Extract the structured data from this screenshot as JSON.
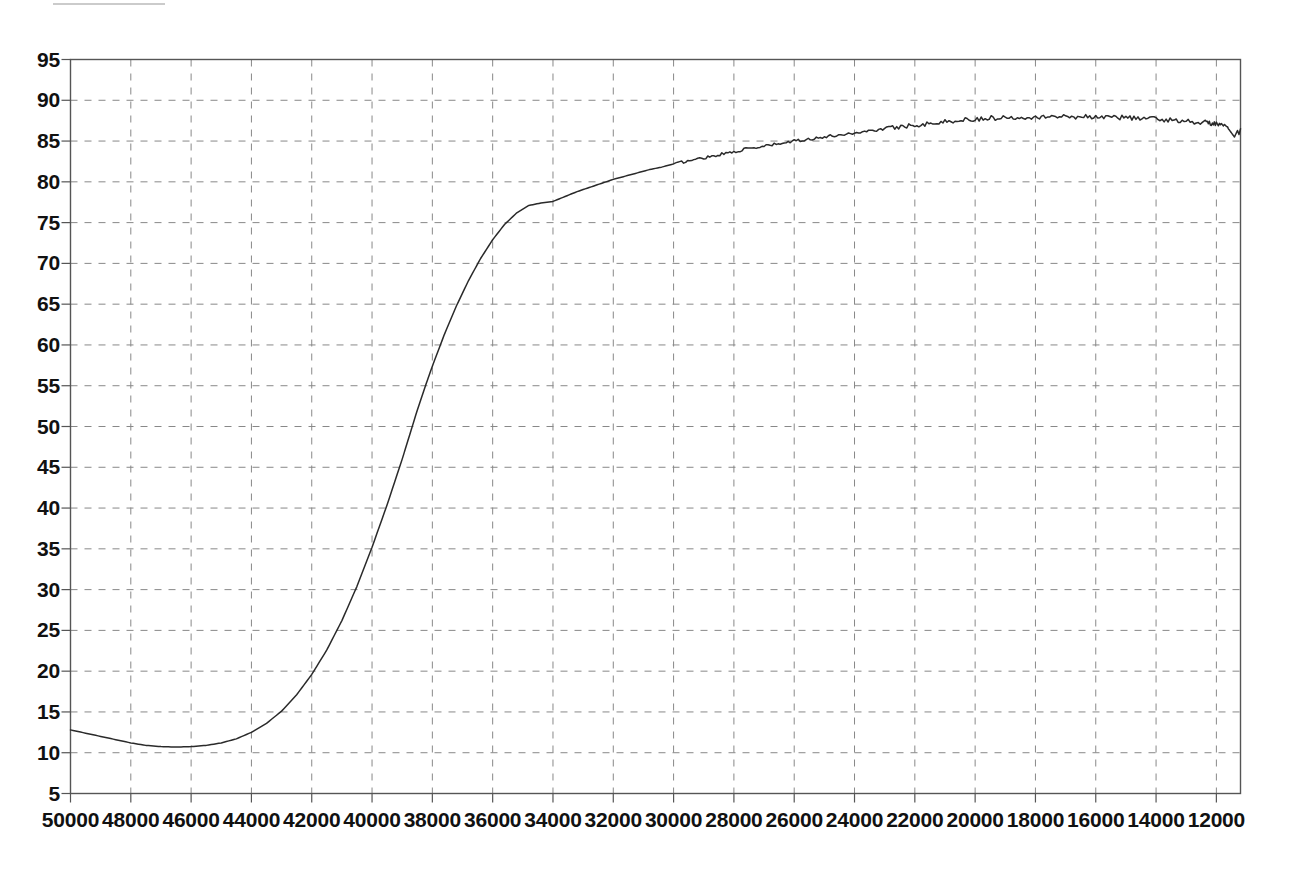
{
  "figure": {
    "name": "spectrum-plot",
    "background_color": "#ffffff",
    "axis_color": "#555555",
    "grid_color": "#888888",
    "curve_color": "#2a2a2a"
  },
  "chart_data": {
    "type": "line",
    "title": "",
    "subtitle": "",
    "xlabel": "",
    "ylabel": "",
    "grid": true,
    "grid_style": "dashed",
    "legend": false,
    "legend_position": "none",
    "x_axis_reversed": true,
    "xlim": [
      50000,
      11200
    ],
    "ylim": [
      5,
      95
    ],
    "x_tick_step": 2000,
    "y_tick_step": 5,
    "xticks": [
      50000,
      48000,
      46000,
      44000,
      42000,
      40000,
      38000,
      36000,
      34000,
      32000,
      30000,
      28000,
      26000,
      24000,
      22000,
      20000,
      18000,
      16000,
      14000,
      12000
    ],
    "xtick_labels": [
      "50000",
      "48000",
      "46000",
      "44000",
      "42000",
      "40000",
      "38000",
      "36000",
      "34000",
      "32000",
      "30000",
      "28000",
      "26000",
      "24000",
      "22000",
      "20000",
      "18000",
      "16000",
      "14000",
      "12000"
    ],
    "yticks": [
      95,
      90,
      85,
      80,
      75,
      70,
      65,
      60,
      55,
      50,
      45,
      40,
      35,
      30,
      25,
      20,
      15,
      10,
      5
    ],
    "ytick_labels": [
      "95",
      "90",
      "85",
      "80",
      "75",
      "70",
      "65",
      "60",
      "55",
      "50",
      "45",
      "40",
      "35",
      "30",
      "25",
      "20",
      "15",
      "10",
      "5"
    ],
    "series": [
      {
        "name": "transmittance",
        "x": [
          50000,
          49500,
          49000,
          48500,
          48000,
          47500,
          47000,
          46500,
          46000,
          45500,
          45000,
          44500,
          44000,
          43500,
          43000,
          42500,
          42000,
          41500,
          41000,
          40500,
          40000,
          39500,
          39000,
          38800,
          38500,
          38200,
          38000,
          37600,
          37200,
          36800,
          36400,
          36000,
          35600,
          35200,
          34800,
          34400,
          34000,
          33600,
          33200,
          32800,
          32400,
          32000,
          31600,
          31200,
          30800,
          30400,
          30000,
          29600,
          29200,
          28800,
          28400,
          28000,
          27600,
          27200,
          26800,
          26400,
          26000,
          25600,
          25200,
          24800,
          24400,
          24000,
          23600,
          23200,
          22800,
          22400,
          22000,
          21600,
          21200,
          20800,
          20400,
          20000,
          19600,
          19200,
          18800,
          18400,
          18000,
          17600,
          17200,
          16800,
          16400,
          16000,
          15600,
          15200,
          14800,
          14400,
          14000,
          13600,
          13200,
          12800,
          12400,
          12200,
          12000,
          11800,
          11600,
          11500,
          11400,
          11300,
          11250,
          11200
        ],
        "y": [
          12.8,
          12.4,
          12.0,
          11.6,
          11.2,
          10.9,
          10.75,
          10.7,
          10.75,
          10.9,
          11.2,
          11.7,
          12.5,
          13.6,
          15.1,
          17.1,
          19.6,
          22.6,
          26.2,
          30.4,
          35.2,
          40.4,
          46.0,
          48.4,
          52.0,
          55.3,
          57.4,
          61.3,
          64.8,
          67.9,
          70.6,
          72.9,
          74.8,
          76.2,
          77.1,
          77.4,
          77.6,
          78.2,
          78.8,
          79.3,
          79.8,
          80.3,
          80.7,
          81.1,
          81.5,
          81.8,
          82.2,
          82.5,
          82.8,
          83.1,
          83.4,
          83.7,
          84.0,
          84.2,
          84.5,
          84.7,
          85.0,
          85.2,
          85.4,
          85.6,
          85.8,
          86.0,
          86.2,
          86.4,
          86.6,
          86.8,
          87.0,
          87.1,
          87.3,
          87.4,
          87.6,
          87.7,
          87.8,
          87.85,
          87.9,
          87.95,
          88.0,
          88.0,
          88.0,
          88.0,
          88.0,
          88.0,
          87.95,
          87.9,
          87.85,
          87.8,
          87.7,
          87.6,
          87.5,
          87.4,
          87.3,
          87.2,
          87.1,
          86.9,
          86.5,
          86.0,
          85.5,
          86.3,
          85.8,
          86.5
        ]
      }
    ],
    "annotations": [
      {
        "name": "curve-start",
        "x": 50000,
        "y": 12.8
      },
      {
        "name": "curve-minimum",
        "x": 46500,
        "y": 10.7
      },
      {
        "name": "curve-knee",
        "x": 34400,
        "y": 77.4
      },
      {
        "name": "curve-maximum",
        "x": 18000,
        "y": 88.0
      },
      {
        "name": "curve-end",
        "x": 11200,
        "y": 86.5
      }
    ]
  }
}
